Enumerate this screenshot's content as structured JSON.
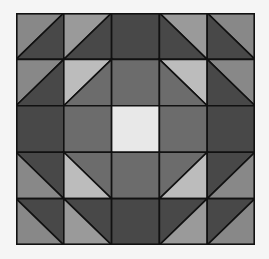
{
  "grid": {
    "rows": 5,
    "cols": 5
  },
  "palette": {
    "dark": "#484848",
    "mid": "#6c6c6c",
    "medium": "#888888",
    "medium_light": "#9a9a9a",
    "light": "#bcbcbc",
    "center": "#e8e8e8",
    "line": "#111111"
  },
  "cells": [
    [
      {
        "type": "half",
        "diag": "/",
        "a": "medium",
        "b": "dark"
      },
      {
        "type": "half",
        "diag": "/",
        "a": "medium_light",
        "b": "dark"
      },
      {
        "type": "solid",
        "fill": "dark"
      },
      {
        "type": "half",
        "diag": "\\",
        "a": "medium_light",
        "b": "dark"
      },
      {
        "type": "half",
        "diag": "\\",
        "a": "medium",
        "b": "dark"
      }
    ],
    [
      {
        "type": "half",
        "diag": "/",
        "a": "medium",
        "b": "dark"
      },
      {
        "type": "half",
        "diag": "/",
        "a": "light",
        "b": "mid"
      },
      {
        "type": "solid",
        "fill": "mid"
      },
      {
        "type": "half",
        "diag": "\\",
        "a": "light",
        "b": "mid"
      },
      {
        "type": "half",
        "diag": "\\",
        "a": "medium",
        "b": "dark"
      }
    ],
    [
      {
        "type": "solid",
        "fill": "dark"
      },
      {
        "type": "solid",
        "fill": "mid"
      },
      {
        "type": "solid",
        "fill": "center"
      },
      {
        "type": "solid",
        "fill": "mid"
      },
      {
        "type": "solid",
        "fill": "dark"
      }
    ],
    [
      {
        "type": "half",
        "diag": "\\",
        "a": "dark",
        "b": "medium"
      },
      {
        "type": "half",
        "diag": "\\",
        "a": "mid",
        "b": "light"
      },
      {
        "type": "solid",
        "fill": "mid"
      },
      {
        "type": "half",
        "diag": "/",
        "a": "mid",
        "b": "light"
      },
      {
        "type": "half",
        "diag": "/",
        "a": "dark",
        "b": "medium"
      }
    ],
    [
      {
        "type": "half",
        "diag": "\\",
        "a": "dark",
        "b": "medium"
      },
      {
        "type": "half",
        "diag": "\\",
        "a": "dark",
        "b": "medium_light"
      },
      {
        "type": "solid",
        "fill": "dark"
      },
      {
        "type": "half",
        "diag": "/",
        "a": "dark",
        "b": "medium_light"
      },
      {
        "type": "half",
        "diag": "/",
        "a": "dark",
        "b": "medium"
      }
    ]
  ]
}
